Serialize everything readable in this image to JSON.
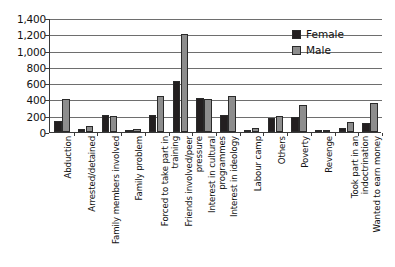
{
  "chart_data": {
    "type": "bar",
    "title": "",
    "subtitle": "",
    "xlabel": "",
    "ylabel": "",
    "ylim": [
      0,
      1400
    ],
    "ytick_step": 200,
    "ytick_labels": [
      "1,400",
      "1,200",
      "1,000",
      "800",
      "600",
      "400",
      "200",
      "0"
    ],
    "ytick_values": [
      1400,
      1200,
      1000,
      800,
      600,
      400,
      200,
      0
    ],
    "grid": true,
    "grid_orientation": "horizontal",
    "legend_position": "top-right-inside",
    "categories": [
      "Abduction",
      "Arrested/detained",
      "Family members involved",
      "Family problem",
      "Forced to take part in training",
      "Friends involved/peer pressure",
      "Interest in cultural programmes",
      "Interest in ideology",
      "Labour camp",
      "Others",
      "Poverty",
      "Revenge",
      "Took part in an indoctrination",
      "Wanted to earn money"
    ],
    "category_lines": [
      [
        "Abduction"
      ],
      [
        "Arrested/detained"
      ],
      [
        "Family members involved"
      ],
      [
        "Family problem"
      ],
      [
        "Forced to take part in",
        "training"
      ],
      [
        "Friends involved/peer",
        "pressure"
      ],
      [
        "Interest in cultural",
        "programmes"
      ],
      [
        "Interest in ideology"
      ],
      [
        "Labour camp"
      ],
      [
        "Others"
      ],
      [
        "Poverty"
      ],
      [
        "Revenge"
      ],
      [
        "Took part in an",
        "indoctrination"
      ],
      [
        "Wanted to earn money"
      ]
    ],
    "series": [
      {
        "name": "Female",
        "color": "#231f20",
        "values": [
          140,
          40,
          205,
          20,
          210,
          630,
          415,
          205,
          25,
          170,
          190,
          20,
          55,
          105
        ]
      },
      {
        "name": "Male",
        "color": "#8d8d8d",
        "values": [
          410,
          70,
          200,
          35,
          445,
          1200,
          400,
          445,
          45,
          195,
          330,
          30,
          125,
          360
        ]
      }
    ]
  }
}
